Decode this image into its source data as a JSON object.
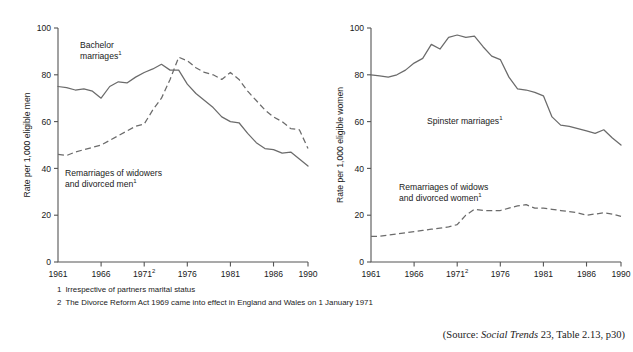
{
  "figure": {
    "source_note_prefix": "(Source: ",
    "source_italic": "Social Trends",
    "source_suffix": " 23, Table 2.13, p30)"
  },
  "footnotes": [
    {
      "num": "1",
      "text": "Irrespective of partners marital status"
    },
    {
      "num": "2",
      "text": "The Divorce Reform Act 1969 came into effect in England and Wales on 1 January 1971"
    }
  ],
  "axis": {
    "y_ticks": [
      "0",
      "20",
      "40",
      "60",
      "80",
      "100"
    ],
    "x_ticks": [
      "1961",
      "1966",
      "1971",
      "1976",
      "1981",
      "1986",
      "1990"
    ],
    "x_tick_sup_index": 2,
    "x_tick_sup": "2",
    "ylim": [
      0,
      100
    ],
    "xlim": [
      1961,
      1990
    ]
  },
  "annotations": {
    "left_series1_l1": "Bachelor",
    "left_series1_l2": "marriages",
    "left_series1_sup": "1",
    "left_series2_l1": "Remarriages of widowers",
    "left_series2_l2": "and divorced men",
    "left_series2_sup": "1",
    "right_series1_l1": "Spinster marriages",
    "right_series1_sup": "1",
    "right_series2_l1": "Remarriages of widows",
    "right_series2_l2": "and divorced women",
    "right_series2_sup": "1"
  },
  "chart_data": [
    {
      "type": "line",
      "id": "men",
      "title": "",
      "xlabel": "",
      "ylabel": "Rate per 1,000 eligible men",
      "xlim": [
        1961,
        1990
      ],
      "ylim": [
        0,
        100
      ],
      "grid": false,
      "legend": "inline-annotations",
      "x": [
        1961,
        1962,
        1963,
        1964,
        1965,
        1966,
        1967,
        1968,
        1969,
        1970,
        1971,
        1972,
        1973,
        1974,
        1975,
        1976,
        1977,
        1978,
        1979,
        1980,
        1981,
        1982,
        1983,
        1984,
        1985,
        1986,
        1987,
        1988,
        1989,
        1990
      ],
      "series": [
        {
          "name": "Bachelor marriages",
          "style": "solid",
          "values": [
            75,
            74.5,
            73.5,
            74,
            73,
            70,
            75,
            77,
            76.5,
            79,
            81,
            82.5,
            84.5,
            82,
            82,
            76,
            72,
            69,
            66,
            62,
            60,
            59.5,
            55,
            51,
            48.5,
            48,
            46.5,
            47,
            44,
            41
          ]
        },
        {
          "name": "Remarriages of widowers and divorced men",
          "style": "dashed",
          "values": [
            46,
            45.5,
            47,
            48,
            49,
            50,
            52,
            54,
            56,
            58,
            59,
            65,
            70,
            78,
            87.5,
            86,
            83,
            81,
            80,
            78,
            81,
            78,
            73,
            69,
            65,
            62,
            60,
            57,
            56.5,
            48.5
          ]
        }
      ]
    },
    {
      "type": "line",
      "id": "women",
      "title": "",
      "xlabel": "",
      "ylabel": "Rate per 1,000 eligible women",
      "xlim": [
        1961,
        1990
      ],
      "ylim": [
        0,
        100
      ],
      "grid": false,
      "legend": "inline-annotations",
      "x": [
        1961,
        1962,
        1963,
        1964,
        1965,
        1966,
        1967,
        1968,
        1969,
        1970,
        1971,
        1972,
        1973,
        1974,
        1975,
        1976,
        1977,
        1978,
        1979,
        1980,
        1981,
        1982,
        1983,
        1984,
        1985,
        1986,
        1987,
        1988,
        1989,
        1990
      ],
      "series": [
        {
          "name": "Spinster marriages",
          "style": "solid",
          "values": [
            80,
            79.5,
            79,
            80,
            82,
            85,
            87,
            93,
            91,
            96,
            97,
            96,
            96.5,
            92,
            88,
            86.5,
            79,
            74,
            73.5,
            72.5,
            71,
            62,
            58.5,
            58,
            57,
            56,
            55,
            56.5,
            53,
            50
          ]
        },
        {
          "name": "Remarriages of widows and divorced women",
          "style": "dashed",
          "values": [
            11,
            11,
            11.5,
            12,
            12.5,
            13,
            13.5,
            14,
            14.5,
            15,
            16,
            20,
            22.5,
            22,
            22,
            22,
            23,
            24,
            24.5,
            23,
            23,
            22.5,
            22,
            21.5,
            21,
            20,
            20.5,
            21,
            20.5,
            19.5
          ]
        }
      ]
    }
  ]
}
